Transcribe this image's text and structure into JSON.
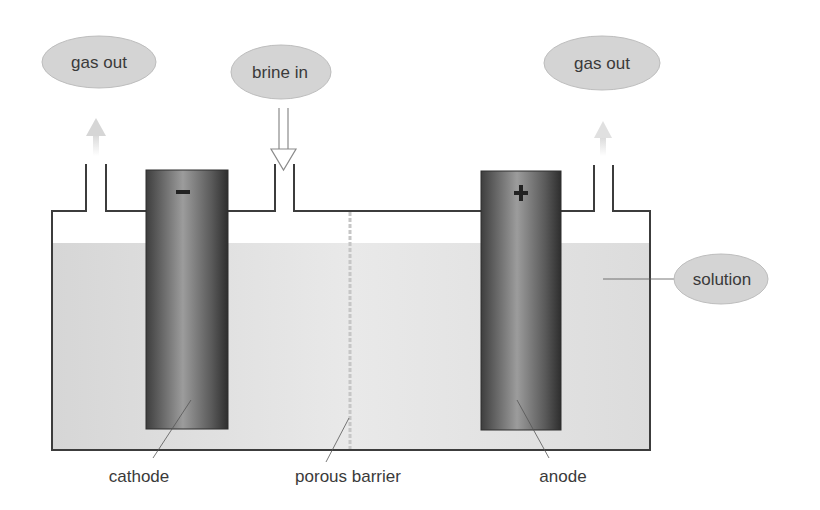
{
  "bubbles": {
    "gas_out_left": "gas out",
    "brine_in": "brine in",
    "gas_out_right": "gas out",
    "solution": "solution"
  },
  "labels": {
    "cathode": "cathode",
    "porous_barrier": "porous barrier",
    "anode": "anode"
  },
  "electrodes": {
    "cathode_sign": "−",
    "anode_sign": "+"
  },
  "colors": {
    "bubble_fill": "#d4d4d4",
    "solution_fill": "#d9d9d9",
    "solution_right_fill": "#e4e4e4",
    "tank_outline": "#3c3c3c",
    "electrode_dark": "#3a3a3a",
    "electrode_light": "#9a9a9a",
    "text": "#3a3a3a",
    "arrow_faint": "#d8d8d8"
  }
}
